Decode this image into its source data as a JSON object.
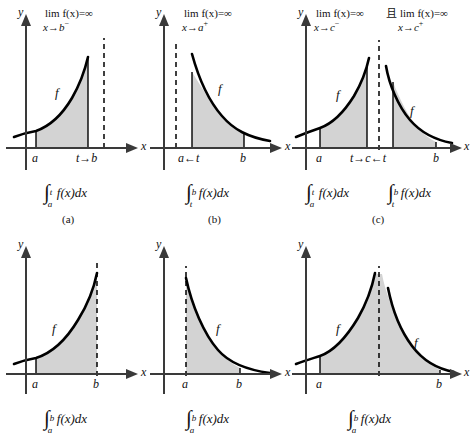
{
  "figure": {
    "colors": {
      "curve": "#000000",
      "axis": "#3a3a3a",
      "shade": "#d3d3d3",
      "dashed": "#000000",
      "background": "#ffffff"
    }
  },
  "panels": [
    {
      "id": "a",
      "caption": "(a)",
      "limit": {
        "line1": "lim f(x)=∞",
        "line2_var": "x",
        "line2_arrow": "→",
        "line2_point": "b",
        "line2_side": "−"
      },
      "axis_y_label": "y",
      "axis_x_label": "x",
      "tick_labels": [
        "a",
        "t→b"
      ],
      "curve_label": "f",
      "integral": {
        "symbol": "∫",
        "lower": "a",
        "upper": "t",
        "body": "f(x)dx"
      },
      "curve_type": "increasing-asymptote-right",
      "shade_from": "a",
      "shade_to": "t",
      "dashed_at": "b"
    },
    {
      "id": "b",
      "caption": "(b)",
      "limit": {
        "line1": "lim f(x)=∞",
        "line2_var": "x",
        "line2_arrow": "→",
        "line2_point": "a",
        "line2_side": "+"
      },
      "axis_y_label": "y",
      "axis_x_label": "x",
      "tick_labels": [
        "a←t",
        "b"
      ],
      "curve_label": "f",
      "integral": {
        "symbol": "∫",
        "lower": "t",
        "upper": "b",
        "body": "f(x)dx"
      },
      "curve_type": "decreasing-asymptote-left",
      "shade_from": "t",
      "shade_to": "b",
      "dashed_at": "a"
    },
    {
      "id": "c",
      "caption": "(c)",
      "limit_left": {
        "line1": "lim f(x)=∞",
        "line2_var": "x",
        "line2_arrow": "→",
        "line2_point": "c",
        "line2_side": "−"
      },
      "conjunction": "且",
      "limit_right": {
        "line1": "lim f(x)=∞",
        "line2_var": "x",
        "line2_arrow": "→",
        "line2_point": "c",
        "line2_side": "+"
      },
      "axis_y_label": "y",
      "axis_x_label": "x",
      "tick_labels": [
        "a",
        "t→c←t",
        "b"
      ],
      "curve_label_left": "f",
      "curve_label_right": "f",
      "integral_left": {
        "symbol": "∫",
        "lower": "a",
        "upper": "t",
        "body": "f(x)dx"
      },
      "integral_right": {
        "symbol": "∫",
        "lower": "t",
        "upper": "b",
        "body": "f(x)dx"
      },
      "curve_type": "two-sided-asymptote-center",
      "dashed_at": "c"
    },
    {
      "id": "d",
      "caption": "",
      "axis_y_label": "y",
      "axis_x_label": "x",
      "tick_labels": [
        "a",
        "b"
      ],
      "curve_label": "f",
      "integral": {
        "symbol": "∫",
        "lower": "a",
        "upper": "b",
        "body": "f(x)dx"
      },
      "curve_type": "increasing-asymptote-right",
      "shade_from": "a",
      "shade_to": "b",
      "dashed_at": "b"
    },
    {
      "id": "e",
      "caption": "",
      "axis_y_label": "y",
      "axis_x_label": "x",
      "tick_labels": [
        "a",
        "b"
      ],
      "curve_label": "f",
      "integral": {
        "symbol": "∫",
        "lower": "a",
        "upper": "b",
        "body": "f(x)dx"
      },
      "curve_type": "decreasing-asymptote-left",
      "shade_from": "a",
      "shade_to": "b",
      "dashed_at": "a"
    },
    {
      "id": "f",
      "caption": "",
      "axis_y_label": "y",
      "axis_x_label": "x",
      "tick_labels": [
        "a",
        "b"
      ],
      "curve_label_left": "f",
      "curve_label_right": "f",
      "integral": {
        "symbol": "∫",
        "lower": "a",
        "upper": "b",
        "body": "f(x)dx"
      },
      "curve_type": "two-sided-asymptote-center",
      "shade_from": "a",
      "shade_to": "b",
      "dashed_at": "c"
    }
  ]
}
